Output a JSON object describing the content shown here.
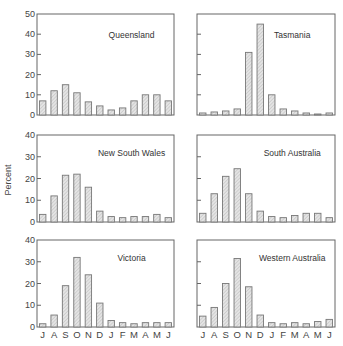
{
  "chart_data": {
    "type": "bar",
    "layout": "small-multiples 3x2",
    "ylabel": "Percent",
    "xlabel": "",
    "categories": [
      "J",
      "A",
      "S",
      "O",
      "N",
      "D",
      "J",
      "F",
      "M",
      "A",
      "M",
      "J"
    ],
    "grid": false,
    "legend": null,
    "panels": [
      {
        "title": "Queensland",
        "ylim": [
          0,
          50
        ],
        "yticks": [
          0,
          10,
          20,
          30,
          40,
          50
        ],
        "show_ytick_labels": true,
        "values": [
          7,
          12,
          15,
          11,
          6.5,
          4.5,
          2.5,
          3.5,
          7,
          10,
          10,
          7
        ]
      },
      {
        "title": "Tasmania",
        "ylim": [
          0,
          50
        ],
        "yticks": [
          0,
          10,
          20,
          30,
          40,
          50
        ],
        "show_ytick_labels": false,
        "values": [
          1,
          1.5,
          2,
          3,
          31,
          45,
          10,
          3,
          2,
          1,
          0.5,
          1
        ]
      },
      {
        "title": "New South Wales",
        "ylim": [
          0,
          40
        ],
        "yticks": [
          0,
          10,
          20,
          30,
          40
        ],
        "show_ytick_labels": true,
        "values": [
          3.5,
          12,
          21.5,
          22,
          16,
          5,
          2.5,
          2,
          2.5,
          2.5,
          3.5,
          2
        ]
      },
      {
        "title": "South Australia",
        "ylim": [
          0,
          40
        ],
        "yticks": [
          0,
          10,
          20,
          30,
          40
        ],
        "show_ytick_labels": false,
        "values": [
          4,
          13,
          21,
          24.5,
          13,
          5,
          2.5,
          2,
          3,
          4,
          4,
          2
        ]
      },
      {
        "title": "Victoria",
        "ylim": [
          0,
          40
        ],
        "yticks": [
          0,
          10,
          20,
          30,
          40
        ],
        "show_ytick_labels": true,
        "values": [
          1.5,
          5.5,
          19,
          32,
          24,
          11,
          3,
          2,
          1.5,
          2,
          2,
          2
        ]
      },
      {
        "title": "Western Australia",
        "ylim": [
          0,
          40
        ],
        "yticks": [
          0,
          10,
          20,
          30,
          40
        ],
        "show_ytick_labels": false,
        "values": [
          5,
          9,
          20,
          31.5,
          18.5,
          5.5,
          2,
          1.5,
          2,
          1.5,
          2.5,
          3.5
        ]
      }
    ]
  },
  "geometry": {
    "cols": [
      {
        "x0": 37,
        "x1": 174
      },
      {
        "x0": 197,
        "x1": 335
      }
    ],
    "rows": [
      {
        "top": 14,
        "base": 115
      },
      {
        "top": 135,
        "base": 222
      },
      {
        "top": 240,
        "base": 327
      }
    ],
    "month_label_y": 338,
    "ylabel_x": 11,
    "ylabel_y": 180
  }
}
